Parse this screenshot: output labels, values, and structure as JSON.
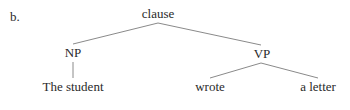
{
  "figure": {
    "example_label": "b.",
    "tree": {
      "root": {
        "label": "clause",
        "children": [
          {
            "label": "NP",
            "children": [
              {
                "label": "The student"
              }
            ]
          },
          {
            "label": "VP",
            "children": [
              {
                "label": "wrote"
              },
              {
                "label": "a letter"
              }
            ]
          }
        ]
      }
    },
    "colors": {
      "text": "#2a2a2a",
      "edge": "#8a8a8a",
      "background": "#ffffff"
    }
  }
}
